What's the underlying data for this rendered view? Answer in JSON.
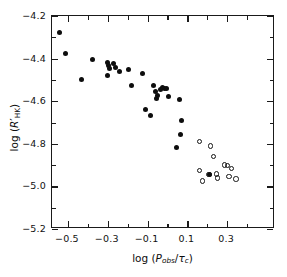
{
  "chart_data": {
    "type": "scatter",
    "title": "",
    "xlabel": "log (P_obs/τ_c)",
    "ylabel": "log (R'_HK)",
    "xlim": [
      -0.58,
      0.54
    ],
    "ylim": [
      -5.2,
      -4.2
    ],
    "grid": false,
    "legend": "none",
    "x_major_ticks": [
      -0.5,
      -0.3,
      -0.1,
      0.1,
      0.3
    ],
    "x_major_tick_labels": [
      "−0.5",
      "−0.3",
      "−0.1",
      "0.1",
      "0.3"
    ],
    "x_minor_ticks": [
      -0.4,
      -0.2,
      0.0,
      0.2,
      0.4
    ],
    "y_major_ticks": [
      -4.2,
      -4.4,
      -4.6,
      -4.8,
      -5.0,
      -5.2
    ],
    "y_major_tick_labels": [
      "−4.2",
      "−4.4",
      "−4.6",
      "−4.8",
      "−5.0",
      "−5.2"
    ],
    "y_minor_ticks": [
      -4.3,
      -4.5,
      -4.7,
      -4.9,
      -5.1
    ],
    "series": [
      {
        "name": "filled-circles",
        "marker": "filled-circle",
        "color": "#0d0d0d",
        "points": [
          [
            -0.543,
            -4.278
          ],
          [
            -0.513,
            -4.377
          ],
          [
            -0.432,
            -4.497
          ],
          [
            -0.375,
            -4.403
          ],
          [
            -0.302,
            -4.42
          ],
          [
            -0.296,
            -4.431
          ],
          [
            -0.293,
            -4.447
          ],
          [
            -0.299,
            -4.481
          ],
          [
            -0.272,
            -4.425
          ],
          [
            -0.259,
            -4.44
          ],
          [
            -0.243,
            -4.459
          ],
          [
            -0.196,
            -4.452
          ],
          [
            -0.183,
            -4.524
          ],
          [
            -0.126,
            -4.47
          ],
          [
            -0.11,
            -4.637
          ],
          [
            -0.085,
            -4.668
          ],
          [
            -0.072,
            -4.528
          ],
          [
            -0.058,
            -4.556
          ],
          [
            -0.054,
            -4.586
          ],
          [
            -0.049,
            -4.571
          ],
          [
            -0.036,
            -4.545
          ],
          [
            -0.027,
            -4.538
          ],
          [
            -0.013,
            -4.542
          ],
          [
            -0.004,
            -4.541
          ],
          [
            0.005,
            -4.578
          ],
          [
            0.062,
            -4.593
          ],
          [
            0.072,
            -4.69
          ],
          [
            0.063,
            -4.758
          ],
          [
            0.047,
            -4.816
          ],
          [
            0.211,
            -4.944
          ]
        ]
      },
      {
        "name": "open-circles",
        "marker": "open-circle",
        "color": "#141414",
        "points": [
          [
            0.16,
            -4.79
          ],
          [
            0.215,
            -4.81
          ],
          [
            0.232,
            -4.861
          ],
          [
            0.16,
            -4.926
          ],
          [
            0.209,
            -4.944
          ],
          [
            0.245,
            -4.941
          ],
          [
            0.176,
            -4.975
          ],
          [
            0.252,
            -4.96
          ],
          [
            0.287,
            -4.9
          ],
          [
            0.3,
            -4.901
          ],
          [
            0.32,
            -4.916
          ],
          [
            0.308,
            -4.953
          ],
          [
            0.345,
            -4.966
          ]
        ]
      }
    ]
  }
}
